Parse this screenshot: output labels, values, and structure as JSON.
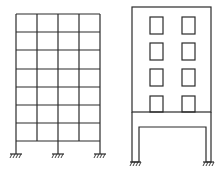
{
  "diagram": {
    "title": "",
    "figures": [
      {
        "name": "moment-frame",
        "description": "7-storey, 4-bay rigid frame with fixed supports at 3 columns",
        "bays": 4,
        "storeys": 7
      },
      {
        "name": "soft-storey-building",
        "description": "Building with 4 rows x 2 columns of windows over an open portal frame ground storey",
        "window_rows": 4,
        "window_cols": 2
      }
    ],
    "colors": {
      "stroke": "#2a2a2a",
      "background": "#ffffff"
    }
  }
}
